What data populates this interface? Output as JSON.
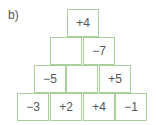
{
  "label": "b)",
  "pyramid": {
    "rows": [
      [
        "+4"
      ],
      [
        "",
        "−7"
      ],
      [
        "−5",
        "",
        "+5"
      ],
      [
        "−3",
        "+2",
        "+4",
        "−1"
      ]
    ]
  },
  "colors": {
    "border": "#a9cf9a",
    "text": "#555555"
  }
}
